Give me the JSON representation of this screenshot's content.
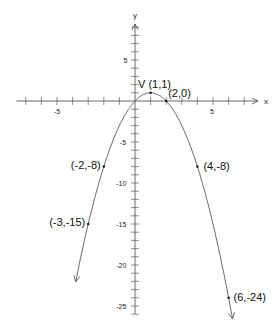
{
  "chart_data": {
    "type": "line",
    "title": "",
    "xlabel": "x",
    "ylabel": "y",
    "xlim": [
      -7.6,
      7.8
    ],
    "ylim": [
      -26.5,
      9.5
    ],
    "grid": false,
    "function": "y = -(x-1)^2 + 1",
    "x_tick_labels": [
      {
        "value": -5,
        "label": "-5"
      },
      {
        "value": 5,
        "label": "5"
      }
    ],
    "y_tick_labels": [
      {
        "value": 5,
        "label": "5"
      },
      {
        "value": -5,
        "label": "-5"
      },
      {
        "value": -10,
        "label": "-10"
      },
      {
        "value": -15,
        "label": "-15"
      },
      {
        "value": -20,
        "label": "-20"
      },
      {
        "value": -25,
        "label": "-25"
      }
    ],
    "curve_range": [
      -3.8,
      6.25
    ],
    "points": [
      {
        "x": 1,
        "y": 1,
        "label": "V (1,1)"
      },
      {
        "x": 2,
        "y": 0,
        "label": "(2,0)"
      },
      {
        "x": -2,
        "y": -8,
        "label": "(-2,-8)"
      },
      {
        "x": 4,
        "y": -8,
        "label": "(4,-8)"
      },
      {
        "x": -3,
        "y": -15,
        "label": "(-3,-15)"
      },
      {
        "x": 6,
        "y": -24,
        "label": "(6,-24)"
      }
    ],
    "color": "#555555"
  }
}
